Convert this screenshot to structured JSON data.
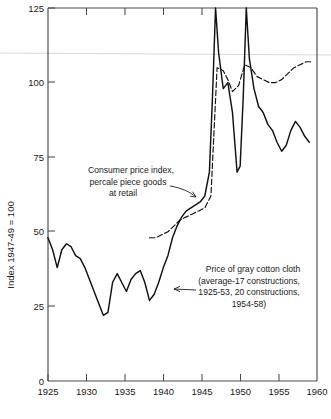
{
  "chart_data": {
    "type": "line",
    "title": "",
    "xlabel": "",
    "ylabel": "Index 1947-49 = 100",
    "xlim": [
      1923.5,
      1960
    ],
    "ylim": [
      0,
      125
    ],
    "xticks": [
      1925,
      1930,
      1935,
      1940,
      1945,
      1950,
      1955,
      1960
    ],
    "yticks": [
      0,
      25,
      50,
      75,
      100,
      125
    ],
    "xtick_labels": [
      "1925",
      "1930",
      "1935",
      "1940",
      "1945",
      "1950",
      "1955",
      "1960"
    ],
    "ytick_labels": [
      "0",
      "25",
      "50",
      "75",
      "100",
      "125"
    ],
    "grid": false,
    "legend": "none",
    "series": [
      {
        "name": "Price of gray cotton cloth",
        "style": "solid",
        "x": [
          1925,
          1925.6,
          1926.2,
          1926.8,
          1927.4,
          1928,
          1928.6,
          1929.2,
          1929.8,
          1930.4,
          1931,
          1931.6,
          1932.2,
          1932.8,
          1933.4,
          1934,
          1934.6,
          1935.2,
          1935.8,
          1936.4,
          1937,
          1937.6,
          1938.2,
          1938.8,
          1939.4,
          1940,
          1940.6,
          1941.2,
          1941.8,
          1942.4,
          1943,
          1943.6,
          1944.2,
          1944.8,
          1945.4,
          1946,
          1946.4,
          1946.8,
          1947.2,
          1947.8,
          1948.4,
          1949,
          1949.6,
          1950,
          1950.4,
          1950.8,
          1951.2,
          1951.8,
          1952.4,
          1953,
          1953.6,
          1954.2,
          1954.8,
          1955.4,
          1956,
          1956.6,
          1957.2,
          1957.8,
          1958.4,
          1959
        ],
        "y": [
          48,
          44,
          38,
          44,
          46,
          45,
          42,
          41,
          38,
          34,
          30,
          26,
          22,
          23,
          33,
          36,
          33,
          30,
          34,
          36,
          37,
          33,
          27,
          29,
          33,
          38,
          42,
          48,
          52,
          55,
          57,
          58,
          59,
          60,
          62,
          70,
          95,
          125,
          110,
          98,
          100,
          90,
          70,
          72,
          95,
          125,
          108,
          98,
          92,
          90,
          86,
          84,
          80,
          77,
          79,
          84,
          87,
          85,
          82,
          80
        ]
      },
      {
        "name": "Consumer price index, percale piece goods at retail",
        "style": "dashed",
        "x": [
          1938.2,
          1939,
          1939.8,
          1940.6,
          1941.4,
          1942.2,
          1943,
          1943.8,
          1944.6,
          1945.4,
          1946.2,
          1947,
          1947.8,
          1948.4,
          1949,
          1949.8,
          1950.6,
          1951.4,
          1952.2,
          1953,
          1953.8,
          1954.6,
          1955.4,
          1956.2,
          1957,
          1957.8,
          1958.6,
          1959.4
        ],
        "y": [
          48,
          48,
          49,
          50,
          52,
          54,
          55,
          56,
          57,
          58,
          62,
          105,
          104,
          101,
          97,
          99,
          106,
          105,
          102,
          101,
          100,
          100,
          101,
          103,
          105,
          106,
          107,
          107
        ]
      }
    ],
    "annotations": [
      {
        "id": "cpi-label",
        "lines": [
          "Consumer price index,",
          "percale piece goods",
          "at retail"
        ],
        "points_to": "consumer-price-index-series"
      },
      {
        "id": "cloth-label",
        "lines": [
          "Price of gray cotton cloth",
          "(average-17 constructions,",
          "1925-53, 20 constructions,",
          "1954-58)"
        ],
        "points_to": "gray-cotton-cloth-series"
      }
    ]
  }
}
